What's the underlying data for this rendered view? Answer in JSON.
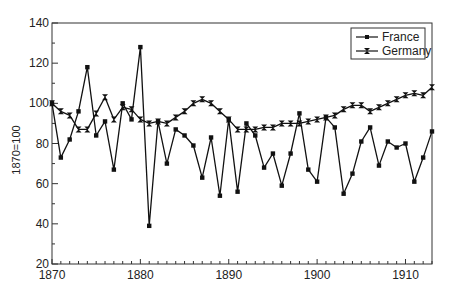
{
  "chart_data": {
    "type": "line",
    "title": "",
    "xlabel": "",
    "ylabel": "1870=100",
    "xlim": [
      1870,
      1913
    ],
    "ylim": [
      20,
      140
    ],
    "grid": false,
    "legend_position": "upper right",
    "x_ticks": [
      1870,
      1880,
      1890,
      1900,
      1910
    ],
    "y_ticks": [
      20,
      40,
      60,
      80,
      100,
      120,
      140
    ],
    "x": [
      1870,
      1871,
      1872,
      1873,
      1874,
      1875,
      1876,
      1877,
      1878,
      1879,
      1880,
      1881,
      1882,
      1883,
      1884,
      1885,
      1886,
      1887,
      1888,
      1889,
      1890,
      1891,
      1892,
      1893,
      1894,
      1895,
      1896,
      1897,
      1898,
      1899,
      1900,
      1901,
      1902,
      1903,
      1904,
      1905,
      1906,
      1907,
      1908,
      1909,
      1910,
      1911,
      1912,
      1913
    ],
    "series": [
      {
        "name": "France",
        "marker": "square",
        "values": [
          100,
          73,
          82,
          96,
          118,
          84,
          91,
          67,
          100,
          92,
          128,
          39,
          91,
          70,
          87,
          84,
          79,
          63,
          83,
          54,
          92,
          56,
          90,
          84,
          68,
          75,
          59,
          75,
          95,
          67,
          61,
          93,
          88,
          55,
          65,
          81,
          88,
          69,
          81,
          78,
          80,
          61,
          73,
          86
        ]
      },
      {
        "name": "Germany",
        "marker": "bowtie",
        "values": [
          100,
          96,
          94,
          87,
          87,
          95,
          103,
          92,
          98,
          97,
          92,
          90,
          91,
          90,
          93,
          96,
          100,
          102,
          100,
          96,
          92,
          87,
          87,
          87,
          88,
          88,
          90,
          90,
          90,
          91,
          92,
          93,
          94,
          97,
          99,
          99,
          96,
          98,
          100,
          102,
          104,
          105,
          104,
          108
        ]
      }
    ]
  },
  "legend": {
    "items": [
      {
        "label": "France"
      },
      {
        "label": "Germany"
      }
    ]
  },
  "axes": {
    "ylabel": "1870=100",
    "x_tick_labels": [
      "1870",
      "1880",
      "1890",
      "1900",
      "1910"
    ],
    "y_tick_labels": [
      "20",
      "40",
      "60",
      "80",
      "100",
      "120",
      "140"
    ]
  }
}
